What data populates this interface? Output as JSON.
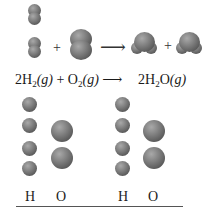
{
  "reaction": {
    "operators": {
      "plus": "+",
      "arrow": "⟶"
    },
    "equation": {
      "reactant1_coeff": "2",
      "reactant1_el": "H",
      "reactant1_sub": "2",
      "reactant1_state": "(g)",
      "plus": "+",
      "reactant2_el": "O",
      "reactant2_sub": "2",
      "reactant2_state": "(g)",
      "arrow": "⟶",
      "product_coeff": "2",
      "product_el1": "H",
      "product_sub": "2",
      "product_el2": "O",
      "product_state": "(g)"
    },
    "molecules": {
      "reactants": [
        "H2",
        "H2",
        "O2"
      ],
      "products": [
        "H2O",
        "H2O"
      ]
    }
  },
  "atom_count": {
    "before": {
      "H_label": "H",
      "O_label": "O",
      "H_count": 4,
      "O_count": 2
    },
    "after": {
      "H_label": "H",
      "O_label": "O",
      "H_count": 4,
      "O_count": 2
    }
  },
  "colors": {
    "atom": "#6e6e6e",
    "rule": "#555555",
    "background": "#ffffff"
  }
}
